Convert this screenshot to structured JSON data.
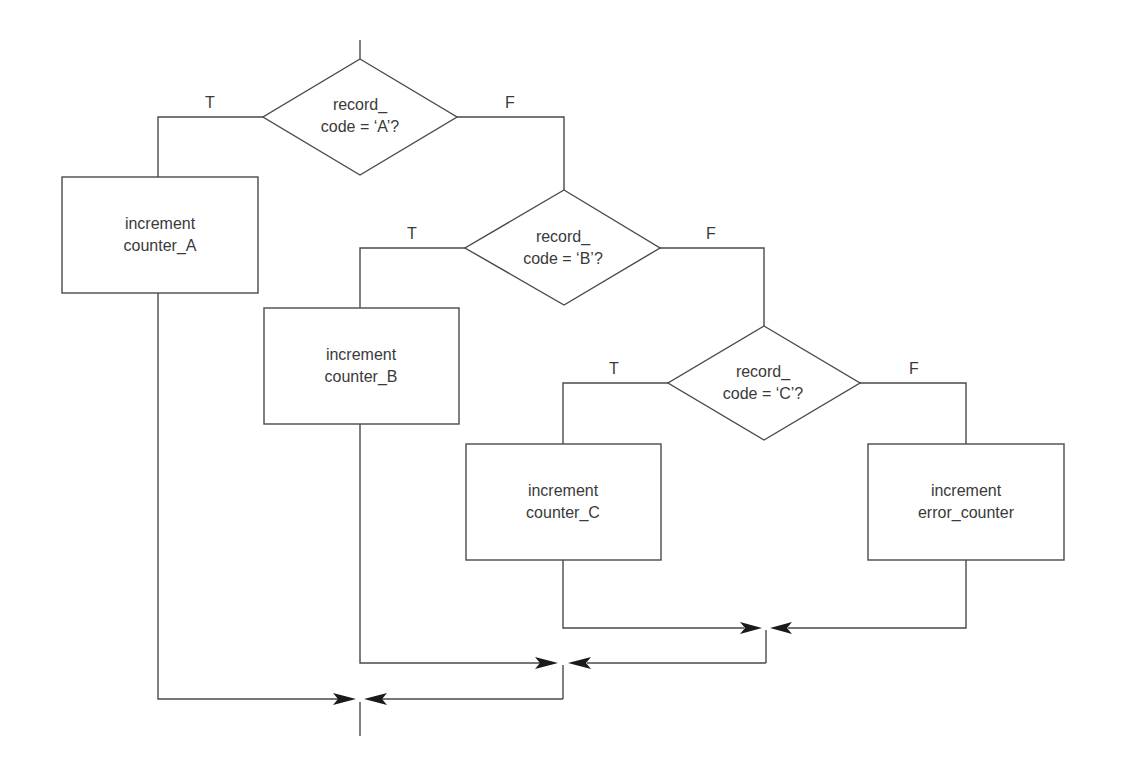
{
  "diagram": {
    "type": "flowchart",
    "colors": {
      "line": "#4a4a4a",
      "text": "#3a3a3a",
      "arrowhead": "#1a1a1a",
      "background": "#ffffff"
    },
    "decisions": [
      {
        "id": "decision_a",
        "line1": "record_",
        "line2": "code = ‘A’?",
        "true_label": "T",
        "false_label": "F"
      },
      {
        "id": "decision_b",
        "line1": "record_",
        "line2": "code = ‘B’?",
        "true_label": "T",
        "false_label": "F"
      },
      {
        "id": "decision_c",
        "line1": "record_",
        "line2": "code = ‘C’?",
        "true_label": "T",
        "false_label": "F"
      }
    ],
    "processes": [
      {
        "id": "process_a",
        "line1": "increment",
        "line2": "counter_A"
      },
      {
        "id": "process_b",
        "line1": "increment",
        "line2": "counter_B"
      },
      {
        "id": "process_c",
        "line1": "increment",
        "line2": "counter_C"
      },
      {
        "id": "process_error",
        "line1": "increment",
        "line2": "error_counter"
      }
    ],
    "edges": [
      {
        "from": "entry",
        "to": "decision_a"
      },
      {
        "from": "decision_a",
        "to": "process_a",
        "label": "T"
      },
      {
        "from": "decision_a",
        "to": "decision_b",
        "label": "F"
      },
      {
        "from": "decision_b",
        "to": "process_b",
        "label": "T"
      },
      {
        "from": "decision_b",
        "to": "decision_c",
        "label": "F"
      },
      {
        "from": "decision_c",
        "to": "process_c",
        "label": "T"
      },
      {
        "from": "decision_c",
        "to": "process_error",
        "label": "F"
      },
      {
        "from": "process_c",
        "to": "join_c"
      },
      {
        "from": "process_error",
        "to": "join_c"
      },
      {
        "from": "process_b",
        "to": "join_b"
      },
      {
        "from": "join_c",
        "to": "join_b"
      },
      {
        "from": "process_a",
        "to": "join_a"
      },
      {
        "from": "join_b",
        "to": "join_a"
      },
      {
        "from": "join_a",
        "to": "exit"
      }
    ]
  }
}
